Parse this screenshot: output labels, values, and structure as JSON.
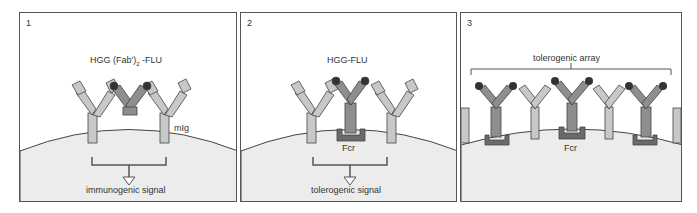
{
  "figure": {
    "panels": [
      {
        "number": "1",
        "antigen_label": "HGG (Fab')",
        "antigen_subscript": "2",
        "antigen_suffix": " -FLU",
        "receptor_label": "mIg",
        "signal_label": "immunogenic signal"
      },
      {
        "number": "2",
        "antigen_label": "HGG-FLU",
        "receptor_label": "Fcr",
        "signal_label": "tolerogenic signal"
      },
      {
        "number": "3",
        "array_label": "tolerogenic array",
        "receptor_label": "Fcr"
      }
    ],
    "colors": {
      "membrane_ig": "#c8c8c8",
      "antigen_ig": "#8e8e8e",
      "fc_receptor": "#6a6a6a",
      "hapten": "#333333",
      "cell": "#ececec",
      "outline": "#444444"
    }
  }
}
